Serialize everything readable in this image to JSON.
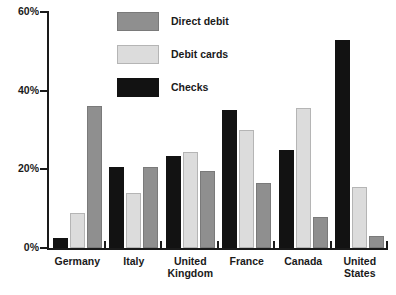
{
  "chart_data": {
    "type": "bar",
    "title": "",
    "xlabel": "",
    "ylabel": "",
    "ylim": [
      0,
      60
    ],
    "ytick_labels": [
      "0%",
      "20%",
      "40%",
      "60%"
    ],
    "ytick_values": [
      0,
      20,
      40,
      60
    ],
    "grid": false,
    "legend_position": "top-left-inside",
    "categories": [
      "Germany",
      "Italy",
      "United Kingdom",
      "France",
      "Canada",
      "United States"
    ],
    "category_label_lines": [
      [
        "Germany"
      ],
      [
        "Italy"
      ],
      [
        "United",
        "Kingdom"
      ],
      [
        "France"
      ],
      [
        "Canada"
      ],
      [
        "United",
        "States"
      ]
    ],
    "series": [
      {
        "name": "Checks",
        "key": "checks",
        "color": "#121212",
        "values": [
          2.5,
          20.5,
          23.5,
          35.0,
          25.0,
          53.0
        ]
      },
      {
        "name": "Debit cards",
        "key": "debit-cards",
        "color": "#dcdcdc",
        "values": [
          9.0,
          14.0,
          24.5,
          30.0,
          35.5,
          15.5
        ]
      },
      {
        "name": "Direct debit",
        "key": "direct-debit",
        "color": "#8f8f8f",
        "values": [
          36.0,
          20.5,
          19.5,
          16.5,
          8.0,
          3.0
        ]
      }
    ]
  },
  "legend": {
    "items": [
      {
        "label": "Direct debit",
        "key": "direct-debit"
      },
      {
        "label": "Debit cards",
        "key": "debit-cards"
      },
      {
        "label": "Checks",
        "key": "checks"
      }
    ]
  }
}
